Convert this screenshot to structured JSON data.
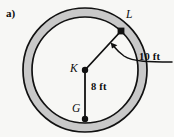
{
  "figure": {
    "part_label": "a)",
    "background_color": "#f7f7f5",
    "shape": "annulus",
    "band_fill_color": "#c9c9c9",
    "stroke_color": "#111111",
    "center": {
      "name": "K",
      "x": 85,
      "y": 70
    },
    "outer_radius_px": 62,
    "inner_radius_px": 53,
    "points": [
      {
        "name": "L",
        "label": "L",
        "x": 121,
        "y": 31,
        "marker": "square",
        "on": "inner-circle"
      },
      {
        "name": "K",
        "label": "K",
        "x": 85,
        "y": 70,
        "marker": "dot",
        "on": "center"
      },
      {
        "name": "G",
        "label": "G",
        "x": 85,
        "y": 119,
        "marker": "dot",
        "on": "inner-circle"
      }
    ],
    "segments": [
      {
        "name": "segment-KL",
        "from": "K",
        "to": "L",
        "label": ""
      },
      {
        "name": "segment-KG",
        "from": "K",
        "to": "G",
        "label": "8 ft"
      }
    ],
    "dimensions": [
      {
        "name": "inner-radius-dimension",
        "label": "8 ft",
        "value": 8,
        "unit": "ft",
        "applies_to": "segment-KG"
      },
      {
        "name": "band-width-dimension",
        "label": "10 ft",
        "value": 10,
        "unit": "ft",
        "applies_to": "annulus-band"
      }
    ],
    "leader": {
      "name": "leader-arrow-10ft",
      "from_label": "10 ft",
      "points_to": "annulus-band",
      "arrow_tip": {
        "x": 112,
        "y": 45
      }
    }
  }
}
